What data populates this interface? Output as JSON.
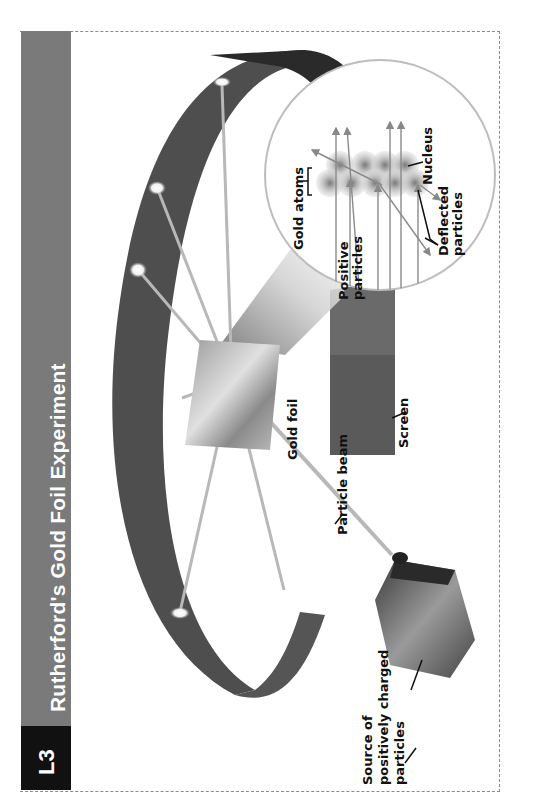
{
  "header": {
    "badge": "L3",
    "title": "Rutherford's Gold Foil Experiment"
  },
  "labels": {
    "source_line1": "Source of",
    "source_line2": "positively charged",
    "source_line3": "particles",
    "particle_beam": "Particle beam",
    "gold_foil": "Gold foil",
    "screen": "Screen",
    "gold_atoms": "Gold atoms",
    "positive_line1": "Positive",
    "positive_line2": "particles",
    "nucleus": "Nucleus",
    "deflected_line1": "Deflected",
    "deflected_line2": "particles"
  },
  "colors": {
    "title_bar": "#7a7a7a",
    "badge": "#111111",
    "screen_dark": "#2e2e2e",
    "screen_mid": "#5a5a5a",
    "beam": "#b8b8b8",
    "inset_border": "#bdbdbd"
  },
  "orientation": "rotated 90deg counter-clockwise"
}
